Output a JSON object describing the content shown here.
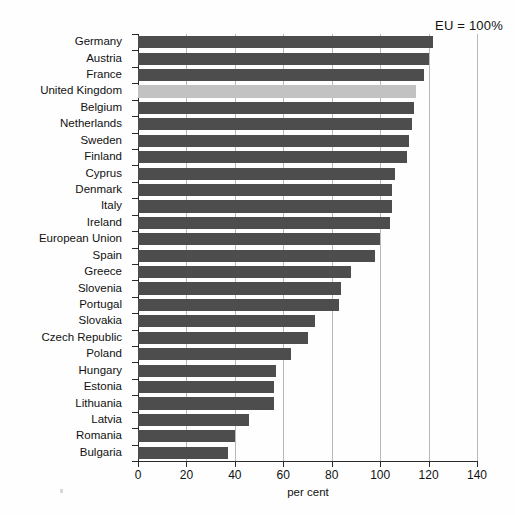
{
  "annotation": {
    "eu_reference": "EU = 100%"
  },
  "axis": {
    "x_title": "per cent",
    "x_ticks": [
      "0",
      "20",
      "40",
      "60",
      "80",
      "100",
      "120",
      "140"
    ]
  },
  "colors": {
    "bar": "#4d4d4d",
    "bar_highlight": "#c2c2c2",
    "gridline": "#b9b9b9",
    "axis": "#2a2a2a",
    "background": "#fefefe"
  },
  "chart_data": {
    "type": "bar",
    "orientation": "horizontal",
    "title": "",
    "subtitle": "",
    "xlabel": "per cent",
    "ylabel": "",
    "xlim": [
      0,
      140
    ],
    "xticks": [
      0,
      20,
      40,
      60,
      80,
      100,
      120,
      140
    ],
    "grid": true,
    "legend": false,
    "annotations": [
      "EU = 100%"
    ],
    "highlight_category": "United Kingdom",
    "categories": [
      "Germany",
      "Austria",
      "France",
      "United Kingdom",
      "Belgium",
      "Netherlands",
      "Sweden",
      "Finland",
      "Cyprus",
      "Denmark",
      "Italy",
      "Ireland",
      "European Union",
      "Spain",
      "Greece",
      "Slovenia",
      "Portugal",
      "Slovakia",
      "Czech Republic",
      "Poland",
      "Hungary",
      "Estonia",
      "Lithuania",
      "Latvia",
      "Romania",
      "Bulgaria"
    ],
    "values": [
      122,
      120,
      118,
      115,
      114,
      113,
      112,
      111,
      106,
      105,
      105,
      104,
      100,
      98,
      88,
      84,
      83,
      73,
      70,
      63,
      57,
      56,
      56,
      46,
      40,
      37
    ]
  }
}
